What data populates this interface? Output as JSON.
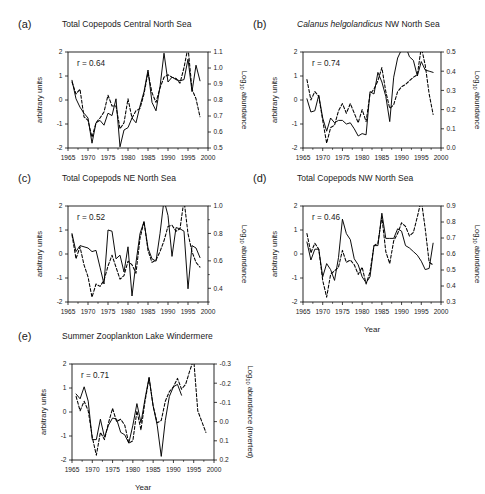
{
  "figure": {
    "background": "#ffffff",
    "series_colors": {
      "solid": "#000000",
      "dashed": "#000000"
    },
    "xlabel": "Year",
    "x_ticks": [
      1965,
      1970,
      1975,
      1980,
      1985,
      1990,
      1995,
      2000
    ],
    "left_axis_label": "arbitrary units",
    "left_ticks": [
      -2,
      -1,
      0,
      1,
      2
    ],
    "right_axis_label_main": "Log",
    "right_axis_label_sub": "10",
    "right_axis_label_tail": " abundance"
  },
  "chart_data": [
    {
      "id": "a",
      "type": "line",
      "letter": "(a)",
      "title": "Total Copepods Central North Sea",
      "title_italic_prefix": "",
      "annotation": "r = 0.64",
      "r_value": 0.64,
      "xlabel": "",
      "ylabel": "arbitrary units",
      "ylabel_right": "Log10 abundance",
      "ylabel_right_inverted": false,
      "xlim": [
        1965,
        2000
      ],
      "ylim": [
        -2,
        2
      ],
      "right_lim": [
        0.5,
        1.1
      ],
      "right_ticks": [
        0.5,
        0.6,
        0.7,
        0.8,
        0.9,
        1.0,
        1.1
      ],
      "right_tick_labels": [
        "0.5",
        "0.6",
        "0.7",
        "0.8",
        "0.9",
        "1.0",
        "1.1"
      ],
      "grid": false,
      "legend": "none",
      "x": [
        1966,
        1967,
        1968,
        1969,
        1970,
        1971,
        1972,
        1973,
        1974,
        1975,
        1976,
        1977,
        1978,
        1979,
        1980,
        1981,
        1982,
        1983,
        1984,
        1985,
        1986,
        1987,
        1988,
        1989,
        1990,
        1991,
        1992,
        1993,
        1994,
        1995,
        1996,
        1997,
        1998
      ],
      "series": [
        {
          "name": "arbitrary units (solid)",
          "style": "solid",
          "values": [
            0.82,
            0.05,
            -0.3,
            -0.55,
            -0.75,
            -1.8,
            -0.95,
            -0.85,
            -1.05,
            -0.55,
            -0.65,
            0.05,
            -1.95,
            -1.25,
            -1.15,
            -0.75,
            -0.95,
            -0.25,
            0.35,
            1.25,
            -0.1,
            -0.45,
            0.55,
            1.95,
            0.75,
            0.95,
            0.85,
            0.8,
            0.85,
            1.7,
            0.35,
            1.45,
            0.8
          ]
        },
        {
          "name": "log10 abundance (dashed)",
          "style": "dashed",
          "values": [
            0.75,
            0.25,
            0.45,
            -0.7,
            -0.85,
            -1.55,
            -0.95,
            -0.75,
            -0.5,
            0.2,
            -0.25,
            -0.25,
            -1.2,
            -0.95,
            0.05,
            -0.75,
            -0.45,
            -0.35,
            0.25,
            1.15,
            0.3,
            -0.1,
            0.5,
            0.95,
            1.05,
            0.95,
            0.9,
            0.7,
            1.35,
            2.2,
            0.45,
            0.05,
            -0.7
          ]
        }
      ]
    },
    {
      "id": "b",
      "type": "line",
      "letter": "(b)",
      "title": "Calanus helgolandicus NW North Sea",
      "title_italic_prefix": "Calanus helgolandicus",
      "title_plain_suffix": " NW North Sea",
      "annotation": "r = 0.74",
      "r_value": 0.74,
      "xlabel": "",
      "ylabel": "arbitrary units",
      "ylabel_right": "Log10 abundance",
      "ylabel_right_inverted": false,
      "xlim": [
        1965,
        2000
      ],
      "ylim": [
        -2,
        2
      ],
      "right_lim": [
        0.0,
        0.5
      ],
      "right_ticks": [
        0.0,
        0.1,
        0.2,
        0.3,
        0.4,
        0.5
      ],
      "right_tick_labels": [
        "0.0",
        "0.1",
        "0.2",
        "0.3",
        "0.4",
        "0.5"
      ],
      "grid": false,
      "legend": "none",
      "x": [
        1966,
        1967,
        1968,
        1969,
        1970,
        1971,
        1972,
        1973,
        1974,
        1975,
        1976,
        1977,
        1978,
        1979,
        1980,
        1981,
        1982,
        1983,
        1984,
        1985,
        1986,
        1987,
        1988,
        1989,
        1990,
        1991,
        1992,
        1993,
        1994,
        1995,
        1996,
        1997,
        1998
      ],
      "series": [
        {
          "name": "arbitrary units (solid)",
          "style": "solid",
          "values": [
            0.05,
            -0.5,
            -0.45,
            0.2,
            -0.75,
            -1.3,
            -0.75,
            -0.95,
            -0.85,
            -0.85,
            -1.0,
            -0.95,
            -1.2,
            -1.5,
            -1.4,
            -1.45,
            0.35,
            0.25,
            1.15,
            0.75,
            0.15,
            -0.9,
            0.95,
            1.75,
            2.1,
            2.25,
            1.8,
            1.65,
            1.0,
            1.6,
            1.25,
            1.2,
            1.15
          ]
        },
        {
          "name": "log10 abundance (dashed)",
          "style": "dashed",
          "values": [
            0.85,
            0.0,
            0.35,
            0.15,
            -0.85,
            -1.8,
            -1.15,
            -1.05,
            -0.45,
            -0.15,
            -0.55,
            -0.15,
            -0.55,
            -0.95,
            -0.4,
            -0.9,
            0.25,
            0.45,
            0.8,
            1.35,
            0.35,
            -0.35,
            -0.2,
            0.35,
            0.55,
            0.65,
            0.8,
            0.95,
            1.05,
            2.2,
            1.45,
            0.25,
            -0.6
          ]
        }
      ]
    },
    {
      "id": "c",
      "type": "line",
      "letter": "(c)",
      "title": "Total Copepods NE North Sea",
      "title_italic_prefix": "",
      "annotation": "r = 0.52",
      "r_value": 0.52,
      "xlabel": "",
      "ylabel": "arbitrary units",
      "ylabel_right": "Log10 abundance",
      "ylabel_right_inverted": false,
      "xlim": [
        1965,
        2000
      ],
      "ylim": [
        -2,
        2
      ],
      "right_lim": [
        0.3,
        1.0
      ],
      "right_ticks": [
        0.4,
        0.6,
        0.8,
        1.0
      ],
      "right_tick_labels": [
        "0.4",
        "0.6",
        "0.8",
        "1.0"
      ],
      "grid": false,
      "legend": "none",
      "x": [
        1966,
        1967,
        1968,
        1969,
        1970,
        1971,
        1972,
        1973,
        1974,
        1975,
        1976,
        1977,
        1978,
        1979,
        1980,
        1981,
        1982,
        1983,
        1984,
        1985,
        1986,
        1987,
        1988,
        1989,
        1990,
        1991,
        1992,
        1993,
        1994,
        1995,
        1996,
        1997,
        1998
      ],
      "series": [
        {
          "name": "arbitrary units (solid)",
          "style": "solid",
          "values": [
            0.85,
            0.1,
            0.35,
            0.3,
            0.25,
            0.1,
            0.15,
            -0.55,
            -1.25,
            1.0,
            0.95,
            -0.2,
            -0.05,
            -0.75,
            0.3,
            -1.75,
            -0.35,
            0.85,
            1.35,
            0.25,
            -0.2,
            -0.3,
            0.85,
            2.25,
            1.6,
            -0.1,
            1.1,
            1.05,
            0.95,
            -1.45,
            0.35,
            0.25,
            -0.15
          ]
        },
        {
          "name": "log10 abundance (dashed)",
          "style": "dashed",
          "values": [
            0.8,
            -0.2,
            0.3,
            -0.45,
            -0.95,
            -1.8,
            -1.25,
            -1.35,
            -1.1,
            -0.5,
            -0.05,
            -0.55,
            -1.05,
            -0.9,
            -0.3,
            -0.45,
            -0.8,
            0.65,
            1.35,
            0.15,
            -0.35,
            -0.25,
            0.1,
            0.55,
            1.15,
            1.2,
            0.95,
            1.05,
            2.25,
            0.85,
            0.1,
            -0.35,
            -0.55
          ]
        }
      ]
    },
    {
      "id": "d",
      "type": "line",
      "letter": "(d)",
      "title": "Total Copepods NW North Sea",
      "title_italic_prefix": "",
      "annotation": "r = 0.46",
      "r_value": 0.46,
      "xlabel": "Year",
      "ylabel": "arbitrary units",
      "ylabel_right": "Log10 abundance",
      "ylabel_right_inverted": false,
      "xlim": [
        1965,
        2000
      ],
      "ylim": [
        -2,
        2
      ],
      "right_lim": [
        0.3,
        0.9
      ],
      "right_ticks": [
        0.3,
        0.4,
        0.5,
        0.6,
        0.7,
        0.8,
        0.9
      ],
      "right_tick_labels": [
        "0.3",
        "0.4",
        "0.5",
        "0.6",
        "0.7",
        "0.8",
        "0.9"
      ],
      "grid": false,
      "legend": "none",
      "x": [
        1966,
        1967,
        1968,
        1969,
        1970,
        1971,
        1972,
        1973,
        1974,
        1975,
        1976,
        1977,
        1978,
        1979,
        1980,
        1981,
        1982,
        1983,
        1984,
        1985,
        1986,
        1987,
        1988,
        1989,
        1990,
        1991,
        1992,
        1993,
        1994,
        1995,
        1996,
        1997,
        1998
      ],
      "series": [
        {
          "name": "arbitrary units (solid)",
          "style": "solid",
          "values": [
            0.5,
            -0.25,
            0.2,
            0.2,
            -0.95,
            -0.4,
            -0.65,
            -1.1,
            -0.15,
            1.45,
            0.85,
            0.6,
            -0.2,
            -0.45,
            -0.95,
            -1.2,
            -0.95,
            0.35,
            0.35,
            1.7,
            0.65,
            0.65,
            0.65,
            1.05,
            0.95,
            0.35,
            0.25,
            0.1,
            -0.05,
            -0.3,
            -0.65,
            -0.6,
            0.45
          ]
        },
        {
          "name": "log10 abundance (dashed)",
          "style": "dashed",
          "values": [
            0.85,
            0.05,
            0.45,
            0.2,
            -1.1,
            -1.8,
            -0.85,
            -0.7,
            -0.55,
            0.15,
            -0.35,
            -0.25,
            -0.45,
            -0.85,
            -0.55,
            -1.25,
            -0.75,
            0.35,
            0.45,
            1.55,
            0.1,
            -0.4,
            0.55,
            0.85,
            1.3,
            1.15,
            0.75,
            0.9,
            1.55,
            2.25,
            1.05,
            -0.35,
            -0.45
          ]
        }
      ]
    },
    {
      "id": "e",
      "type": "line",
      "letter": "(e)",
      "title": "Summer Zooplankton Lake Windermere",
      "title_italic_prefix": "",
      "annotation": "r = 0.71",
      "r_value": 0.71,
      "xlabel": "Year",
      "ylabel": "arbitrary units",
      "ylabel_right": "Log10 abundance (inverted)",
      "ylabel_right_inverted": true,
      "xlim": [
        1965,
        2000
      ],
      "ylim": [
        -2,
        2
      ],
      "right_lim": [
        0.2,
        -0.3
      ],
      "right_ticks": [
        -0.3,
        -0.2,
        -0.1,
        0.0,
        0.1,
        0.2
      ],
      "right_tick_labels": [
        "-0.3",
        "-0.2",
        "-0.1",
        "0.0",
        "0.1",
        "0.2"
      ],
      "grid": false,
      "legend": "none",
      "x": [
        1966,
        1967,
        1968,
        1969,
        1970,
        1971,
        1972,
        1973,
        1974,
        1975,
        1976,
        1977,
        1978,
        1979,
        1980,
        1981,
        1982,
        1983,
        1984,
        1985,
        1986,
        1987,
        1988,
        1989,
        1990,
        1991,
        1992,
        1993,
        1994,
        1995,
        1996,
        1997,
        1998
      ],
      "series": [
        {
          "name": "arbitrary units (solid)",
          "style": "solid",
          "values": [
            0.75,
            0.55,
            1.05,
            0.45,
            -1.15,
            -1.15,
            -0.3,
            -1.05,
            -0.55,
            -0.25,
            -0.3,
            -0.85,
            -0.95,
            -1.3,
            -0.55,
            0.35,
            -0.45,
            0.55,
            1.45,
            0.25,
            -0.55,
            -1.85,
            -0.35,
            0.65,
            1.05,
            1.15,
            0.7,
            null,
            null,
            null,
            null,
            null,
            null
          ]
        },
        {
          "name": "log10 abundance inverted (dashed)",
          "style": "dashed",
          "values": [
            0.65,
            0.05,
            0.45,
            0.05,
            -1.05,
            -1.8,
            -0.85,
            -1.15,
            -0.45,
            0.15,
            -0.4,
            -0.3,
            -0.55,
            -1.3,
            -1.2,
            0.05,
            -0.75,
            0.45,
            1.4,
            0.25,
            -0.45,
            -0.35,
            0.45,
            0.85,
            1.05,
            1.4,
            0.95,
            1.15,
            1.7,
            2.2,
            0.05,
            -0.4,
            -0.85
          ]
        }
      ]
    }
  ]
}
